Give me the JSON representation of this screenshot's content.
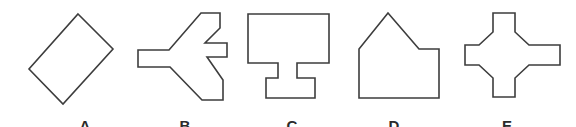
{
  "figure": {
    "background": "#ffffff",
    "stroke_color": "#3d3d3d",
    "stroke_width": 1.6,
    "label_color": "#2b2b2b",
    "label_font_size": 15,
    "label_baseline_y": 131,
    "width": 576,
    "height": 127,
    "shapes": [
      {
        "id": "shape-a",
        "label": "A",
        "name": "rotated-rectangle-shape",
        "points": "78,14 113,49 63,104 29,69",
        "label_x": 85
      },
      {
        "id": "shape-b",
        "label": "B",
        "name": "left-pointing-jet-shape",
        "points": "138,50 169,50 201,13 220,13 220,28 205,43 227,43 227,57 207,57 223,80 223,100 202,100 170,67 138,67",
        "label_x": 185
      },
      {
        "id": "shape-c",
        "label": "C",
        "name": "monitor-with-stand-shape",
        "points": "248,14 329,14 329,63 297,63 297,78 315,78 315,98 266,98 266,78 278,78 278,63 248,63",
        "label_x": 292
      },
      {
        "id": "shape-d",
        "label": "D",
        "name": "house-with-ledge-shape",
        "points": "388,13 419,49 439,49 439,98 359,98 359,49",
        "label_x": 394
      },
      {
        "id": "shape-e",
        "label": "E",
        "name": "chamfered-cross-shape",
        "points": "493,13 515,13 515,32 529,45 560,45 560,65 529,65 515,78 515,97 493,97 493,78 479,65 465,65 465,45 479,45 493,32",
        "label_x": 507
      }
    ]
  }
}
